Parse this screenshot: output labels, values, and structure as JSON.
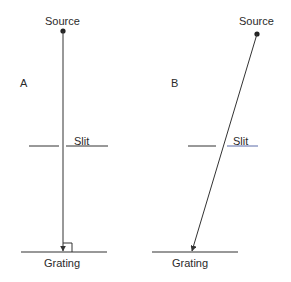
{
  "panels": [
    {
      "id": "A",
      "label": "A",
      "source_label": "Source",
      "slit_label": "Slit",
      "grating_label": "Grating",
      "beam": "normal incidence (perpendicular to grating)",
      "right_angle_marker": true
    },
    {
      "id": "B",
      "label": "B",
      "source_label": "Source",
      "slit_label": "Slit",
      "grating_label": "Grating",
      "beam": "oblique incidence through slit",
      "right_angle_marker": false
    }
  ],
  "colors": {
    "line": "#333333",
    "slit_right_B": "#5a6aa8",
    "text": "#2a2a2a"
  }
}
